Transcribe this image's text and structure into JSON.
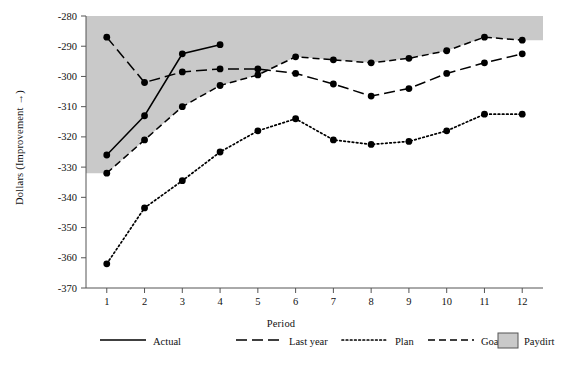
{
  "chart_data": {
    "type": "line",
    "title": "",
    "xlabel": "Period",
    "ylabel": "Dollars (Improvement →)",
    "x": [
      1,
      2,
      3,
      4,
      5,
      6,
      7,
      8,
      9,
      10,
      11,
      12
    ],
    "xtick_labels": [
      "1",
      "2",
      "3",
      "4",
      "5",
      "6",
      "7",
      "8",
      "9",
      "10",
      "11",
      "12"
    ],
    "ytick_labels": [
      "-280",
      "-290",
      "-300",
      "-310",
      "-320",
      "-330",
      "-340",
      "-350",
      "-360",
      "-370"
    ],
    "yticks": [
      -280,
      -290,
      -300,
      -310,
      -320,
      -330,
      -340,
      -350,
      -360,
      -370
    ],
    "ylim": [
      -370,
      -280
    ],
    "xlim": [
      0.45,
      12.55
    ],
    "grid": false,
    "legend_position": "bottom",
    "series": [
      {
        "name": "Actual",
        "style": "solid",
        "color": "#000000",
        "x": [
          1,
          2,
          3,
          4
        ],
        "values": [
          -326.0,
          -313.0,
          -292.5,
          -289.5
        ]
      },
      {
        "name": "Last year",
        "style": "long-dash",
        "color": "#000000",
        "x": [
          1,
          2,
          3,
          4,
          5,
          6,
          7,
          8,
          9,
          10,
          11,
          12
        ],
        "values": [
          -287.0,
          -302.0,
          -298.5,
          -297.5,
          -297.5,
          -299.0,
          -302.5,
          -306.5,
          -304.0,
          -299.0,
          -295.5,
          -292.5
        ]
      },
      {
        "name": "Plan",
        "style": "dotted",
        "color": "#000000",
        "x": [
          1,
          2,
          3,
          4,
          5,
          6,
          7,
          8,
          9,
          10,
          11,
          12
        ],
        "values": [
          -362.0,
          -343.5,
          -334.5,
          -325.0,
          -318.0,
          -314.0,
          -321.0,
          -322.5,
          -321.5,
          -318.0,
          -312.5,
          -312.5
        ]
      },
      {
        "name": "Goal",
        "style": "dashed",
        "color": "#000000",
        "x": [
          1,
          2,
          3,
          4,
          5,
          6,
          7,
          8,
          9,
          10,
          11,
          12
        ],
        "values": [
          -332.0,
          -321.0,
          -310.0,
          -303.0,
          -299.5,
          -293.5,
          -294.5,
          -295.5,
          -294.0,
          -291.5,
          -287.0,
          -288.0
        ]
      }
    ],
    "shaded_region": {
      "name": "Paydirt",
      "color": "#c9c9c9",
      "description": "Region above the Goal line up to the top of the plot"
    },
    "annotations": []
  },
  "legend": {
    "items": [
      {
        "label": "Actual",
        "style": "solid",
        "color": "#000000"
      },
      {
        "label": "Last year",
        "style": "long-dash",
        "color": "#000000"
      },
      {
        "label": "Plan",
        "style": "dotted",
        "color": "#000000"
      },
      {
        "label": "Goal",
        "style": "dashed",
        "color": "#000000"
      },
      {
        "label": "Paydirt",
        "style": "swatch",
        "color": "#c9c9c9"
      }
    ]
  }
}
